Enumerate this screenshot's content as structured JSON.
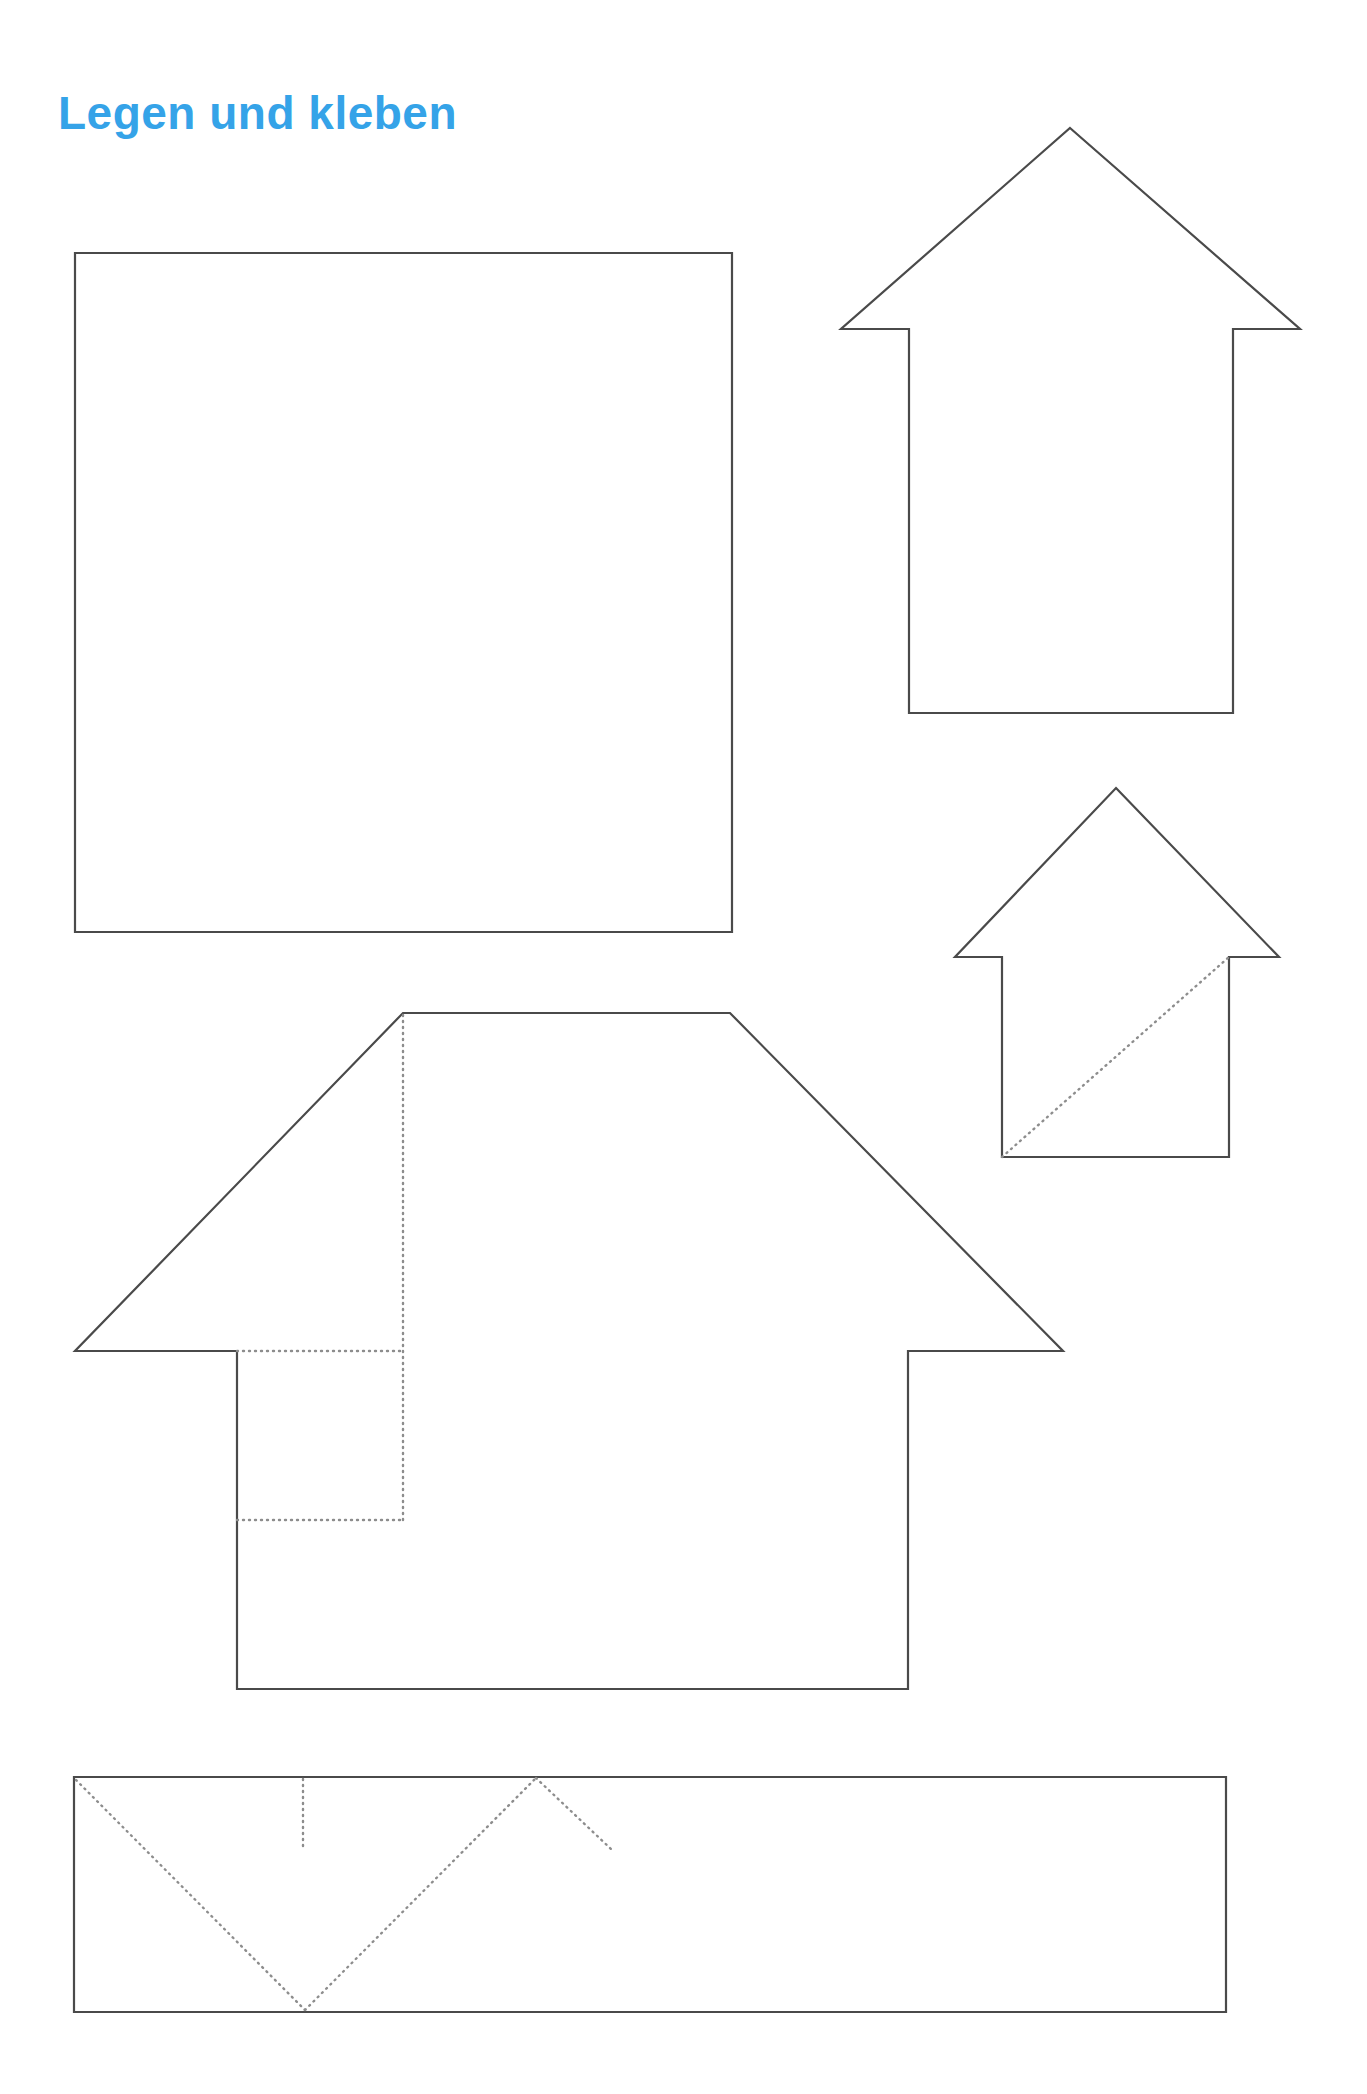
{
  "page": {
    "width": 1367,
    "height": 2094,
    "background_color": "#ffffff",
    "title": "Legen und kleben",
    "title_color": "#35A3E8",
    "cut_line_color": "#4a4a4a",
    "fold_line_color": "#8d8d8d"
  },
  "shapes": [
    {
      "id": "square-template",
      "name": "large-square",
      "kind": "cut-outline",
      "points": "75,253 732,253 732,932 75,932"
    },
    {
      "id": "house-large-right",
      "name": "house-outline-large",
      "kind": "cut-outline",
      "points": "1070,128 1300,329 1233,329 1233,713 909,713 909,329 841,329"
    },
    {
      "id": "house-small-right",
      "name": "house-outline-small",
      "kind": "cut-outline",
      "points": "1116,788 1279,957 1229,957 1229,1157 1002,1157 1002,957 955,957"
    },
    {
      "id": "house-big-middle",
      "name": "house-outline-trapezoid-roof",
      "kind": "cut-outline",
      "points": "403,1013 730,1013 1063,1351 908,1351 908,1689 237,1689 237,1351 75,1351"
    },
    {
      "id": "strip-bottom",
      "name": "bottom-strip",
      "kind": "cut-outline",
      "points": "74,1777 1226,1777 1226,2012 74,2012"
    }
  ],
  "fold_lines": [
    {
      "id": "fold-small-house-diagonal",
      "name": "fold-diagonal-small-house",
      "d": "M 1002 1157 L 1229 957"
    },
    {
      "id": "fold-big-house-vertical",
      "name": "fold-vertical-big-house",
      "d": "M 403 1015 L 403 1520"
    },
    {
      "id": "fold-big-house-upper-horizontal",
      "name": "fold-horizontal-upper-big-house",
      "d": "M 237 1351 L 403 1351"
    },
    {
      "id": "fold-big-house-lower-horizontal",
      "name": "fold-horizontal-lower-big-house",
      "d": "M 237 1520 L 403 1520"
    },
    {
      "id": "fold-strip-v-left",
      "name": "fold-diagonal-strip-left",
      "d": "M 76 1780 L 305 2010"
    },
    {
      "id": "fold-strip-v-right",
      "name": "fold-diagonal-strip-right",
      "d": "M 305 2010 L 536 1778"
    },
    {
      "id": "fold-strip-peak-right",
      "name": "fold-diagonal-strip-peak-right",
      "d": "M 536 1778 L 611 1849"
    },
    {
      "id": "fold-strip-tick",
      "name": "fold-tick-strip",
      "d": "M 303 1779 L 303 1850"
    }
  ]
}
